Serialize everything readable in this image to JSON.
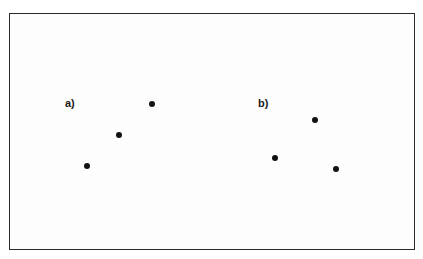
{
  "panels": [
    {
      "label": "a)",
      "label_pos": [
        65,
        98
      ],
      "points": [
        [
          152,
          104
        ],
        [
          119,
          135
        ],
        [
          87,
          166
        ]
      ]
    },
    {
      "label": "b)",
      "label_pos": [
        258,
        98
      ],
      "points": [
        [
          315,
          120
        ],
        [
          275,
          158
        ],
        [
          336,
          169
        ]
      ]
    }
  ],
  "colors": {
    "frame": "#2a2a2a",
    "dot": "#111111",
    "background": "#ffffff"
  }
}
